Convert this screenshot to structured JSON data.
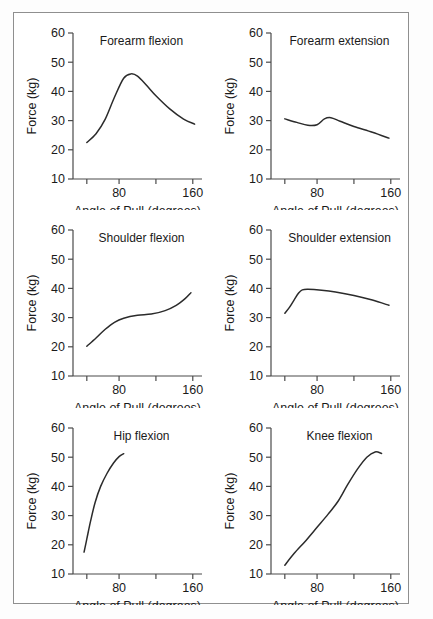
{
  "figure": {
    "panel_count": 6,
    "border_color": "#8f8f8f",
    "curve_color": "#2b2b2b",
    "axis_color": "#4a4a4a"
  },
  "chart_data": [
    {
      "type": "line",
      "title": "Forearm flexion",
      "xlabel": "Angle of Pull (degrees)",
      "ylabel": "Force (kg)",
      "xlim": [
        30,
        170
      ],
      "ylim": [
        10,
        60
      ],
      "xticks": [
        45,
        80,
        120,
        160
      ],
      "xticklabels": [
        "",
        "80",
        "",
        "160"
      ],
      "yticks": [
        10,
        20,
        30,
        40,
        50,
        60
      ],
      "yticklabels": [
        "10",
        "20",
        "30",
        "40",
        "50",
        "60"
      ],
      "grid": false,
      "x": [
        45,
        55,
        65,
        75,
        85,
        93,
        100,
        110,
        120,
        135,
        150,
        162
      ],
      "y": [
        22.5,
        25.5,
        30.5,
        38.0,
        44.5,
        46.0,
        45.2,
        42.0,
        38.5,
        34.0,
        30.5,
        28.8
      ]
    },
    {
      "type": "line",
      "title": "Forearm extension",
      "xlabel": "Angle of Pull (degrees)",
      "ylabel": "Force (kg)",
      "xlim": [
        30,
        170
      ],
      "ylim": [
        10,
        60
      ],
      "xticks": [
        45,
        80,
        120,
        160
      ],
      "xticklabels": [
        "",
        "80",
        "",
        "160"
      ],
      "yticks": [
        10,
        20,
        30,
        40,
        50,
        60
      ],
      "yticklabels": [
        "10",
        "20",
        "30",
        "40",
        "50",
        "60"
      ],
      "grid": false,
      "x": [
        45,
        58,
        70,
        80,
        88,
        95,
        105,
        120,
        140,
        158
      ],
      "y": [
        30.6,
        29.4,
        28.4,
        28.6,
        30.6,
        31.0,
        29.8,
        28.0,
        26.0,
        24.0
      ]
    },
    {
      "type": "line",
      "title": "Shoulder flexion",
      "xlabel": "Angle of Pull (degrees)",
      "ylabel": "Force (kg)",
      "xlim": [
        30,
        170
      ],
      "ylim": [
        10,
        60
      ],
      "xticks": [
        45,
        80,
        120,
        160
      ],
      "xticklabels": [
        "",
        "80",
        "",
        "160"
      ],
      "yticks": [
        10,
        20,
        30,
        40,
        50,
        60
      ],
      "yticklabels": [
        "10",
        "20",
        "30",
        "40",
        "50",
        "60"
      ],
      "grid": false,
      "x": [
        45,
        55,
        65,
        75,
        85,
        100,
        115,
        130,
        142,
        152,
        158
      ],
      "y": [
        20.2,
        23.0,
        26.0,
        28.4,
        29.8,
        30.8,
        31.2,
        32.4,
        34.2,
        36.6,
        38.5
      ]
    },
    {
      "type": "line",
      "title": "Shoulder extension",
      "xlabel": "Angle of Pull (degrees)",
      "ylabel": "Force (kg)",
      "xlim": [
        30,
        170
      ],
      "ylim": [
        10,
        60
      ],
      "xticks": [
        45,
        80,
        120,
        160
      ],
      "xticklabels": [
        "",
        "80",
        "",
        "160"
      ],
      "yticks": [
        10,
        20,
        30,
        40,
        50,
        60
      ],
      "yticklabels": [
        "10",
        "20",
        "30",
        "40",
        "50",
        "60"
      ],
      "grid": false,
      "x": [
        45,
        50,
        55,
        60,
        64,
        70,
        85,
        100,
        120,
        140,
        158
      ],
      "y": [
        31.5,
        33.5,
        36.0,
        38.4,
        39.5,
        39.7,
        39.4,
        38.8,
        37.6,
        36.0,
        34.2
      ]
    },
    {
      "type": "line",
      "title": "Hip flexion",
      "xlabel": "Angle of Pull (degrees)",
      "ylabel": "Force (kg)",
      "xlim": [
        30,
        170
      ],
      "ylim": [
        10,
        60
      ],
      "xticks": [
        45,
        80,
        120,
        160
      ],
      "xticklabels": [
        "",
        "80",
        "",
        "160"
      ],
      "yticks": [
        10,
        20,
        30,
        40,
        50,
        60
      ],
      "yticklabels": [
        "10",
        "20",
        "30",
        "40",
        "50",
        "60"
      ],
      "grid": false,
      "x": [
        42,
        45,
        49,
        54,
        60,
        67,
        74,
        80,
        85
      ],
      "y": [
        17.5,
        22.0,
        28.0,
        34.5,
        40.0,
        44.5,
        48.0,
        50.2,
        51.2
      ]
    },
    {
      "type": "line",
      "title": "Knee flexion",
      "xlabel": "Angle of Pull (degrees)",
      "ylabel": "Force (kg)",
      "xlim": [
        30,
        170
      ],
      "ylim": [
        10,
        60
      ],
      "xticks": [
        45,
        80,
        120,
        160
      ],
      "xticklabels": [
        "",
        "80",
        "",
        "160"
      ],
      "yticks": [
        10,
        20,
        30,
        40,
        50,
        60
      ],
      "yticklabels": [
        "10",
        "20",
        "30",
        "40",
        "50",
        "60"
      ],
      "grid": false,
      "x": [
        45,
        55,
        68,
        80,
        92,
        103,
        113,
        124,
        134,
        143,
        150
      ],
      "y": [
        13.0,
        17.0,
        21.5,
        26.0,
        30.5,
        35.0,
        40.5,
        46.0,
        50.0,
        51.8,
        51.3
      ]
    }
  ]
}
